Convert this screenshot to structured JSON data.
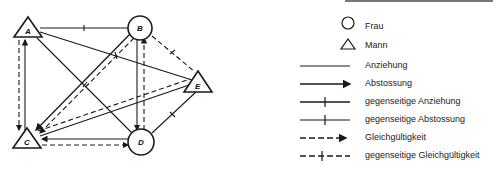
{
  "nodes": {
    "A": {
      "label": "A",
      "shape": "triangle",
      "meaning": "Mann"
    },
    "B": {
      "label": "B",
      "shape": "circle",
      "meaning": "Frau"
    },
    "C": {
      "label": "C",
      "shape": "triangle",
      "meaning": "Mann"
    },
    "D": {
      "label": "D",
      "shape": "circle",
      "meaning": "Frau"
    },
    "E": {
      "label": "E",
      "shape": "triangle",
      "meaning": "Mann"
    }
  },
  "edges": [
    {
      "from": "A",
      "to": "B",
      "type": "gegenseitige Anziehung"
    },
    {
      "from": "A",
      "to": "E",
      "type": "gegenseitige Abstossung"
    },
    {
      "from": "A",
      "to": "D",
      "type": "gegenseitige Anziehung"
    },
    {
      "from": "A",
      "to": "C",
      "type": "Gleichgültigkeit"
    },
    {
      "from": "A",
      "to": "C",
      "type": "Abstossung"
    },
    {
      "from": "B",
      "to": "C",
      "type": "Abstossung"
    },
    {
      "from": "B",
      "to": "C",
      "type": "Gleichgültigkeit"
    },
    {
      "from": "B",
      "to": "D",
      "type": "Abstossung"
    },
    {
      "from": "D",
      "to": "B",
      "type": "Gleichgültigkeit"
    },
    {
      "from": "B",
      "to": "E",
      "type": "gegenseitige Gleichgültigkeit"
    },
    {
      "from": "C",
      "to": "E",
      "type": "Anziehung"
    },
    {
      "from": "E",
      "to": "C",
      "type": "Gleichgültigkeit"
    },
    {
      "from": "D",
      "to": "E",
      "type": "gegenseitige Anziehung"
    },
    {
      "from": "D",
      "to": "C",
      "type": "Abstossung"
    },
    {
      "from": "C",
      "to": "D",
      "type": "Gleichgültigkeit"
    }
  ],
  "legend": {
    "items": [
      {
        "symbol": "circle",
        "label": "Frau"
      },
      {
        "symbol": "triangle",
        "label": "Mann"
      },
      {
        "symbol": "line",
        "label": "Anziehung"
      },
      {
        "symbol": "arrow",
        "label": "Abstossung"
      },
      {
        "symbol": "line-tick",
        "label": "gegenseitige Anziehung"
      },
      {
        "symbol": "line-tick-thin",
        "label": "gegenseitige Abstossung"
      },
      {
        "symbol": "dashed-arrow",
        "label": "Gleichgültigkeit"
      },
      {
        "symbol": "dashed-tick",
        "label": "gegenseitige Gleichgültigkeit"
      }
    ]
  },
  "colors": {
    "ink": "#1a1a1a",
    "background": "#ffffff"
  }
}
